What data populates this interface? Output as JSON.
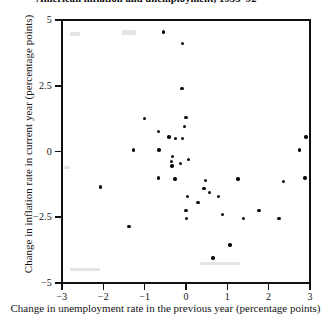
{
  "chart_data": {
    "type": "scatter",
    "title": "American inflation and unemployment, 1953–92",
    "xlabel": "Change in unemployment rate in the previous year (percentage points)",
    "ylabel": "Change in inflation rate in current year (percentage points)",
    "xlim": [
      -3,
      3
    ],
    "ylim": [
      -5,
      5
    ],
    "xticks": [
      -3,
      -2,
      -1,
      0,
      1,
      2,
      3
    ],
    "xtick_labels": [
      "−3",
      "−2",
      "−1",
      "0",
      "1",
      "2",
      "3"
    ],
    "yticks": [
      5,
      2.5,
      0,
      -2.5,
      -5
    ],
    "ytick_labels": [
      "5",
      "2.5",
      "0",
      "−2.5",
      "−5"
    ],
    "grid": false,
    "legend": null,
    "marker": "filled-circle",
    "marker_color": "#0a0a0a",
    "n_points": 40,
    "points": [
      {
        "x": -0.55,
        "y": 4.55
      },
      {
        "x": -0.08,
        "y": 4.1
      },
      {
        "x": -0.1,
        "y": 2.4
      },
      {
        "x": 0.0,
        "y": 1.3
      },
      {
        "x": -0.03,
        "y": 0.95
      },
      {
        "x": -1.0,
        "y": 1.25
      },
      {
        "x": -0.67,
        "y": 0.75
      },
      {
        "x": -0.41,
        "y": 0.55
      },
      {
        "x": -0.26,
        "y": 0.5
      },
      {
        "x": -0.08,
        "y": 0.5
      },
      {
        "x": -1.27,
        "y": 0.05
      },
      {
        "x": -0.65,
        "y": 0.05
      },
      {
        "x": -0.33,
        "y": -0.2
      },
      {
        "x": -0.35,
        "y": -0.38
      },
      {
        "x": -0.34,
        "y": -0.55
      },
      {
        "x": -0.13,
        "y": -0.45
      },
      {
        "x": 0.06,
        "y": -0.3
      },
      {
        "x": -0.66,
        "y": -1.0
      },
      {
        "x": -0.27,
        "y": -1.05
      },
      {
        "x": 0.03,
        "y": -1.7
      },
      {
        "x": -2.07,
        "y": -1.35
      },
      {
        "x": 0.0,
        "y": -2.25
      },
      {
        "x": 0.01,
        "y": -2.55
      },
      {
        "x": 0.47,
        "y": -1.1
      },
      {
        "x": 0.44,
        "y": -1.4
      },
      {
        "x": 0.57,
        "y": -1.55
      },
      {
        "x": 0.79,
        "y": -1.7
      },
      {
        "x": 0.29,
        "y": -1.95
      },
      {
        "x": 0.88,
        "y": -2.4
      },
      {
        "x": 1.26,
        "y": -1.05
      },
      {
        "x": 1.39,
        "y": -2.55
      },
      {
        "x": 1.77,
        "y": -2.25
      },
      {
        "x": 2.36,
        "y": -1.15
      },
      {
        "x": 2.25,
        "y": -2.55
      },
      {
        "x": 1.06,
        "y": -3.55
      },
      {
        "x": 0.65,
        "y": -4.05
      },
      {
        "x": 2.88,
        "y": -1.0
      },
      {
        "x": 2.9,
        "y": 0.55
      },
      {
        "x": 2.75,
        "y": 0.05
      },
      {
        "x": -1.38,
        "y": -2.85
      }
    ]
  }
}
